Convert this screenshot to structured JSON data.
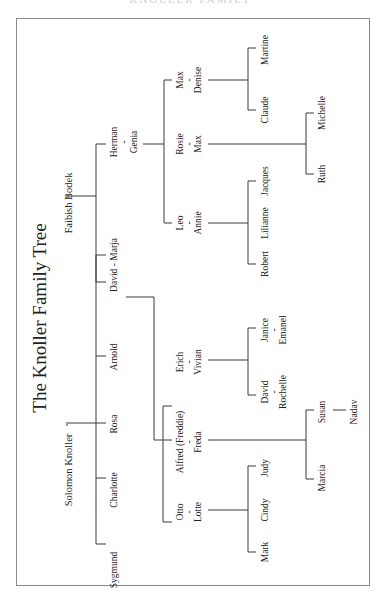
{
  "header": {
    "text": "KNOLLER FAMILY"
  },
  "title": "The Knoller Family Tree",
  "roots": {
    "knoller": "Solomon Knoller",
    "bodek": "Faibish Bodek"
  },
  "gen1": {
    "sygmund": "Sygmund",
    "charlotte": "Charlotte",
    "rosa": "Rosa",
    "arnold": "Arnold",
    "david_marja": "David - Marja",
    "herman": "Herman",
    "genia": "Genia"
  },
  "gen2": {
    "otto": "Otto",
    "lotte": "Lotte",
    "alfred": "Alfred (Freddie)",
    "freda": "Freda",
    "erich": "Erich",
    "vivian": "Vivian",
    "leo": "Leo",
    "annie": "Annie",
    "rosie": "Rosie",
    "max1": "Max",
    "max2": "Max",
    "denise": "Denise",
    "dash": "-"
  },
  "gen3": {
    "mark": "Mark",
    "cindy": "Cindy",
    "judy": "Judy",
    "marcia": "Marcia",
    "susan": "Susan",
    "david": "David",
    "rochelle": "Rochelle",
    "janice": "Janice",
    "emanel": "Emanel",
    "robert": "Robert",
    "lilianne": "Lilianne",
    "jacques": "Jacques",
    "ruth": "Ruth",
    "michelle": "Michelle",
    "claude": "Claude",
    "martine": "Martine"
  },
  "gen4": {
    "nadav": "Nadav"
  }
}
